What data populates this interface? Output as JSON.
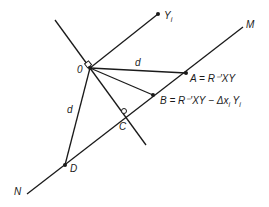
{
  "diagram": {
    "points": {
      "O": {
        "label": "0",
        "x": 90,
        "y": 68
      },
      "Yi": {
        "label": "Y",
        "sub": "i",
        "x": 158,
        "y": 14
      },
      "A": {
        "label": "A = R⁻′XY",
        "x": 186,
        "y": 73
      },
      "B": {
        "label": "B = R⁻′XY − Δx",
        "sub1": "i",
        "mid": " Y",
        "sub2": "i",
        "x": 153,
        "y": 95
      },
      "C": {
        "label": "C",
        "x": 125,
        "y": 115
      },
      "D": {
        "label": "D",
        "x": 65,
        "y": 165
      },
      "M": {
        "label": "M",
        "x": 243,
        "y": 27
      },
      "N": {
        "label": "N",
        "x": 27,
        "y": 194
      }
    },
    "edge_labels": {
      "OA": "d",
      "OD": "d"
    },
    "line_color": "#1a1a1a"
  }
}
